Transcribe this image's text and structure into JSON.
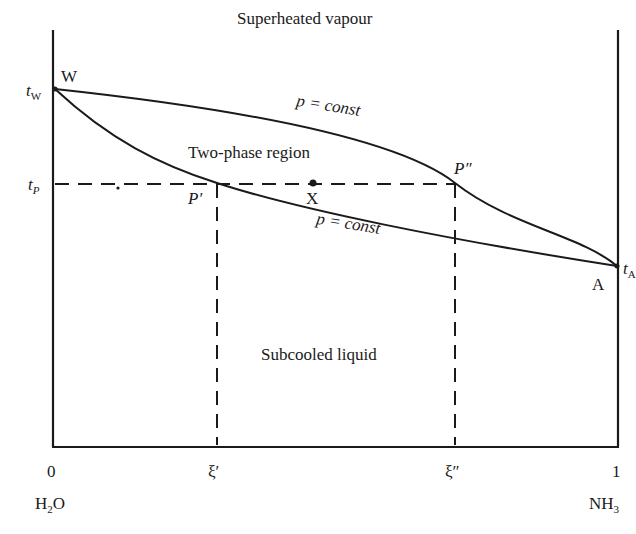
{
  "diagram": {
    "type": "phase-diagram",
    "title": "",
    "regions": {
      "top": "Superheated vapour",
      "middle": "Two-phase region",
      "bottom": "Subcooled liquid"
    },
    "points": {
      "W": "W",
      "A": "A",
      "P1": "P′",
      "P2": "P″",
      "X": "X"
    },
    "y_axis_labels": {
      "tW_main": "t",
      "tW_sub": "W",
      "tP_main": "t",
      "tP_sub": "P",
      "tA_main": "t",
      "tA_sub": "A"
    },
    "curve_labels": {
      "dew": "p = const",
      "bubble": "p = const"
    },
    "x_axis": {
      "ticks": [
        "0",
        "ξ′",
        "ξ″",
        "1"
      ],
      "left_component_main": "H",
      "left_component_sub": "2",
      "left_component_end": "O",
      "right_component_main": "NH",
      "right_component_sub": "3"
    }
  }
}
